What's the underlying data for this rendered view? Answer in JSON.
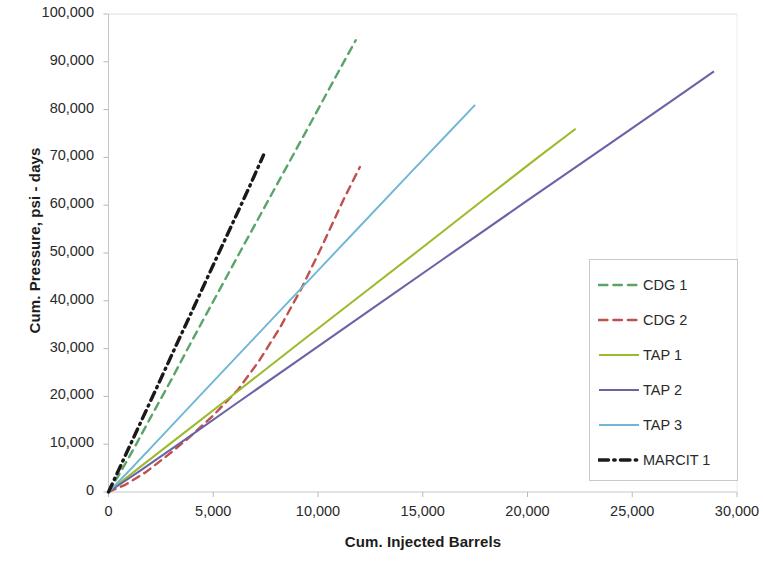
{
  "chart_data": {
    "type": "line",
    "title": "",
    "xlabel": "Cum. Injected Barrels",
    "ylabel": "Cum. Pressure, psi - days",
    "xlim": [
      0,
      30000
    ],
    "ylim": [
      0,
      100000
    ],
    "xticks": [
      "0",
      "5,000",
      "10,000",
      "15,000",
      "20,000",
      "25,000",
      "30,000"
    ],
    "xtick_values": [
      0,
      5000,
      10000,
      15000,
      20000,
      25000,
      30000
    ],
    "yticks": [
      "0",
      "10,000",
      "20,000",
      "30,000",
      "40,000",
      "50,000",
      "60,000",
      "70,000",
      "80,000",
      "90,000",
      "100,000"
    ],
    "ytick_values": [
      0,
      10000,
      20000,
      30000,
      40000,
      50000,
      60000,
      70000,
      80000,
      90000,
      100000
    ],
    "grid": false,
    "legend_position": "right-middle",
    "series": [
      {
        "name": "CDG 1",
        "color": "#5aa469",
        "style": "dashed",
        "width": 2.4,
        "x": [
          0,
          500,
          1200,
          2000,
          3000,
          4000,
          5200,
          6500,
          8000,
          9500,
          10800,
          11800
        ],
        "y": [
          0,
          3600,
          9000,
          15500,
          23500,
          31800,
          41500,
          52000,
          64000,
          76000,
          86500,
          94500
        ]
      },
      {
        "name": "CDG 2",
        "color": "#c0504d",
        "style": "dashed",
        "width": 2.4,
        "x": [
          0,
          800,
          1800,
          2800,
          3800,
          5000,
          6200,
          7200,
          8200,
          9200,
          10200,
          11200,
          12000
        ],
        "y": [
          0,
          1500,
          4200,
          7600,
          11200,
          16000,
          21500,
          27500,
          34500,
          42500,
          51500,
          61000,
          68000
        ]
      },
      {
        "name": "TAP 1",
        "color": "#9bbb2f",
        "style": "solid",
        "width": 2.1,
        "x": [
          0,
          1500,
          3500,
          6000,
          9000,
          12000,
          15000,
          18000,
          20500,
          22300
        ],
        "y": [
          0,
          5200,
          12000,
          20500,
          30800,
          41000,
          51200,
          61500,
          70000,
          76000
        ]
      },
      {
        "name": "TAP 2",
        "color": "#6b63a5",
        "style": "solid",
        "width": 2.1,
        "x": [
          0,
          1500,
          3500,
          6000,
          9000,
          12500,
          16000,
          20000,
          24000,
          27000,
          28900
        ],
        "y": [
          0,
          4400,
          10500,
          18200,
          27400,
          38100,
          48800,
          61000,
          73100,
          82200,
          88000
        ]
      },
      {
        "name": "TAP 3",
        "color": "#6fb7d4",
        "style": "solid",
        "width": 1.9,
        "x": [
          0,
          1000,
          2500,
          4500,
          7000,
          9500,
          12000,
          14500,
          16200,
          17500
        ],
        "y": [
          0,
          4500,
          11500,
          20800,
          32400,
          44000,
          55600,
          67200,
          75000,
          81000
        ]
      },
      {
        "name": "MARCIT 1",
        "color": "#1a1a1a",
        "style": "dashdot",
        "width": 3.4,
        "x": [
          0,
          600,
          1400,
          2300,
          3200,
          4100,
          5000,
          5900,
          6700,
          7400
        ],
        "y": [
          0,
          5700,
          13300,
          21800,
          30400,
          38900,
          47500,
          56000,
          63600,
          70500
        ]
      }
    ]
  },
  "legend": {
    "items": [
      {
        "label": "CDG 1",
        "color": "#5aa469",
        "style": "dashed"
      },
      {
        "label": "CDG 2",
        "color": "#c0504d",
        "style": "dashed"
      },
      {
        "label": "TAP 1",
        "color": "#9bbb2f",
        "style": "solid"
      },
      {
        "label": "TAP 2",
        "color": "#6b63a5",
        "style": "solid"
      },
      {
        "label": "TAP 3",
        "color": "#6fb7d4",
        "style": "solid"
      },
      {
        "label": "MARCIT 1",
        "color": "#1a1a1a",
        "style": "dashdot"
      }
    ]
  },
  "axes": {
    "x_title": "Cum. Injected Barrels",
    "y_title": "Cum. Pressure, psi - days"
  }
}
